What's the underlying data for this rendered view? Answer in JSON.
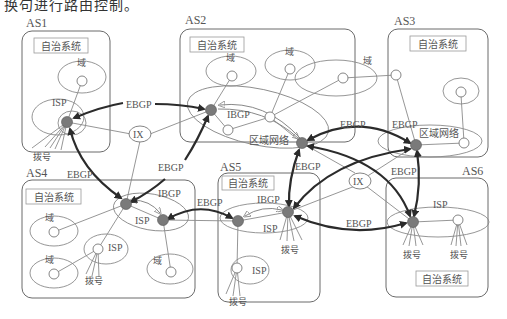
{
  "caption_fragment": "换句进行路由控制。",
  "colors": {
    "box_stroke": "#6b6b6b",
    "thin_line": "#8a8a8a",
    "node_fill": "#7a7a7a",
    "arrow": "#2b2b2b",
    "text": "#555555"
  },
  "autonomous_systems": [
    {
      "id": "AS1",
      "label": "AS1",
      "tag": "自治系统"
    },
    {
      "id": "AS2",
      "label": "AS2",
      "tag": "自治系统"
    },
    {
      "id": "AS3",
      "label": "AS3",
      "tag": "自治系统"
    },
    {
      "id": "AS4",
      "label": "AS4",
      "tag": "自治系统"
    },
    {
      "id": "AS5",
      "label": "AS5",
      "tag": "自治系统"
    },
    {
      "id": "AS6",
      "label": "AS6",
      "tag": "自治系统"
    }
  ],
  "labels": {
    "domain": "域",
    "isp": "ISP",
    "dialup": "拨号",
    "regional_network": "区域网络",
    "ebgp": "EBGP",
    "ibgp": "IBGP",
    "ix": "IX"
  }
}
